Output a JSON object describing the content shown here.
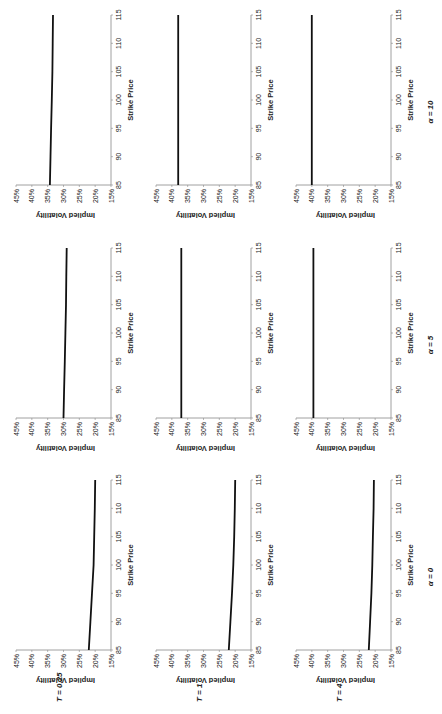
{
  "chart_data": {
    "type": "line",
    "orientation_note": "figure rendered rotated 90 degrees counter-clockwise",
    "grid": false,
    "legend": null,
    "row_labels": [
      "T = 0.25",
      "T = 1",
      "T = 4"
    ],
    "column_labels": [
      "α = 0",
      "α = 5",
      "α = 10"
    ],
    "xlabel": "Strike Price",
    "ylabel": "Implied Volatility",
    "xlim": [
      85,
      115
    ],
    "ylim": [
      0.15,
      0.45
    ],
    "xticks": [
      "85",
      "90",
      "95",
      "100",
      "105",
      "110",
      "115"
    ],
    "yticks": [
      "15%",
      "20%",
      "25%",
      "30%",
      "35%",
      "40%",
      "45%"
    ],
    "x": [
      85,
      90,
      95,
      100,
      105,
      110,
      115
    ],
    "panels": [
      {
        "T": "T = 0.25",
        "alpha": "α = 0",
        "values": [
          0.22,
          0.215,
          0.21,
          0.205,
          0.203,
          0.201,
          0.2
        ]
      },
      {
        "T": "T = 0.25",
        "alpha": "α = 5",
        "values": [
          0.3,
          0.298,
          0.296,
          0.294,
          0.292,
          0.291,
          0.29
        ]
      },
      {
        "T": "T = 0.25",
        "alpha": "α = 10",
        "values": [
          0.343,
          0.341,
          0.339,
          0.337,
          0.335,
          0.334,
          0.333
        ]
      },
      {
        "T": "T = 1",
        "alpha": "α = 0",
        "values": [
          0.22,
          0.215,
          0.21,
          0.206,
          0.203,
          0.201,
          0.2
        ]
      },
      {
        "T": "T = 1",
        "alpha": "α = 5",
        "values": [
          0.37,
          0.37,
          0.37,
          0.37,
          0.37,
          0.37,
          0.37
        ]
      },
      {
        "T": "T = 1",
        "alpha": "α = 10",
        "values": [
          0.38,
          0.38,
          0.38,
          0.38,
          0.38,
          0.38,
          0.38
        ]
      },
      {
        "T": "T = 4",
        "alpha": "α = 0",
        "values": [
          0.22,
          0.216,
          0.212,
          0.209,
          0.207,
          0.205,
          0.204
        ]
      },
      {
        "T": "T = 4",
        "alpha": "α = 5",
        "values": [
          0.395,
          0.395,
          0.395,
          0.395,
          0.395,
          0.395,
          0.395
        ]
      },
      {
        "T": "T = 4",
        "alpha": "α = 10",
        "values": [
          0.4,
          0.4,
          0.4,
          0.4,
          0.4,
          0.4,
          0.4
        ]
      }
    ]
  },
  "figure": {
    "line_color": "#111111",
    "axis_color": "#888888",
    "text_color": "#222222"
  }
}
